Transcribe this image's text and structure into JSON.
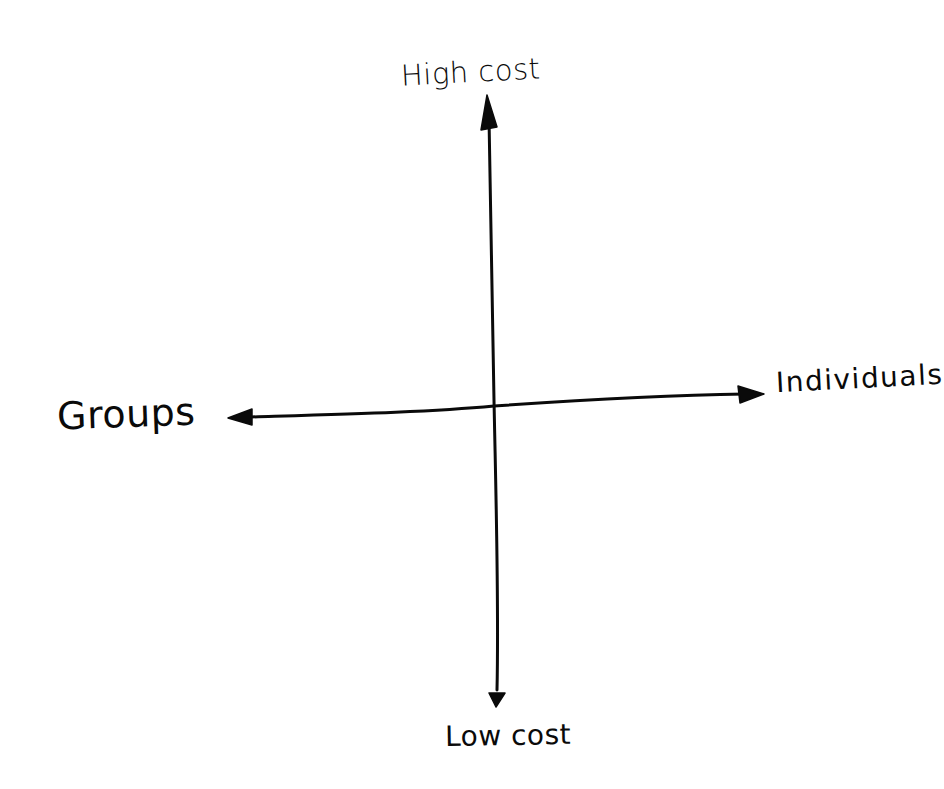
{
  "diagram": {
    "type": "2x2 quadrant / perpendicular axes sketch",
    "style": "hand-drawn, black ink on white",
    "colors": {
      "background": "#ffffff",
      "ink": "#0a0a0a"
    },
    "axes": {
      "vertical": {
        "top_label": "High cost",
        "bottom_label": "Low cost",
        "arrows": "both ends"
      },
      "horizontal": {
        "left_label": "Groups",
        "right_label": "Individuals",
        "arrows": "both ends"
      }
    }
  }
}
